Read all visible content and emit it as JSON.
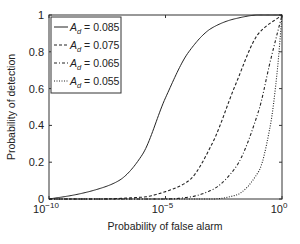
{
  "chart_data": {
    "type": "line",
    "title": "",
    "xlabel": "Probability of false alarm",
    "ylabel": "Probability of detection",
    "xscale": "log",
    "xlim": [
      1e-10,
      1
    ],
    "ylim": [
      0,
      1
    ],
    "x_ticks": [
      {
        "value": -10,
        "label_base": "10",
        "label_exp": "−10"
      },
      {
        "value": -5,
        "label_base": "10",
        "label_exp": "−5"
      },
      {
        "value": 0,
        "label_base": "10",
        "label_exp": "0"
      }
    ],
    "y_ticks": [
      {
        "value": 0,
        "label": "0"
      },
      {
        "value": 0.2,
        "label": "0.2"
      },
      {
        "value": 0.4,
        "label": "0.4"
      },
      {
        "value": 0.6,
        "label": "0.6"
      },
      {
        "value": 0.8,
        "label": "0.8"
      },
      {
        "value": 1,
        "label": "1"
      }
    ],
    "grid": false,
    "legend_position": "upper left",
    "series": [
      {
        "name": "A_d = 0.085",
        "legend_sub": "d",
        "legend_value": " = 0.085",
        "style": "solid",
        "log10_pfa": [
          -10,
          -9,
          -8,
          -7,
          -6,
          -5,
          -4,
          -3,
          -2,
          -1,
          0
        ],
        "pd": [
          0.0,
          0.02,
          0.05,
          0.1,
          0.24,
          0.55,
          0.8,
          0.93,
          0.98,
          1.0,
          1.0
        ]
      },
      {
        "name": "A_d = 0.075",
        "legend_sub": "d",
        "legend_value": " = 0.075",
        "style": "dashed",
        "log10_pfa": [
          -10,
          -8,
          -6,
          -5,
          -4,
          -3,
          -2,
          -1,
          0
        ],
        "pd": [
          0.0,
          0.0,
          0.01,
          0.04,
          0.1,
          0.3,
          0.62,
          0.9,
          1.0
        ]
      },
      {
        "name": "A_d = 0.065",
        "legend_sub": "d",
        "legend_value": " = 0.065",
        "style": "dashdot",
        "log10_pfa": [
          -10,
          -6,
          -5,
          -4,
          -3,
          -2,
          -1,
          -0.5,
          0
        ],
        "pd": [
          0.0,
          0.0,
          0.0,
          0.01,
          0.05,
          0.17,
          0.48,
          0.75,
          1.0
        ]
      },
      {
        "name": "A_d = 0.055",
        "legend_sub": "d",
        "legend_value": " = 0.055",
        "style": "dotted",
        "log10_pfa": [
          -10,
          -4,
          -3,
          -2,
          -1,
          -0.5,
          -0.2,
          0
        ],
        "pd": [
          0.0,
          0.0,
          0.0,
          0.02,
          0.15,
          0.4,
          0.7,
          1.0
        ]
      }
    ]
  }
}
